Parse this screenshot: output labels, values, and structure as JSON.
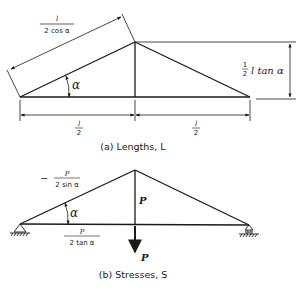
{
  "figure_a": {
    "caption": "(a) Lengths, L",
    "labels": {
      "chord_length_num": "l",
      "chord_length_den": "2 cos α",
      "angle": "α",
      "height_prefix_num": "1",
      "height_prefix_den": "2",
      "height_rest": "l tan α",
      "half_span_left_num": "l",
      "half_span_left_den": "2",
      "half_span_right_num": "l",
      "half_span_right_den": "2"
    }
  },
  "figure_b": {
    "caption": "(b) Stresses, S",
    "labels": {
      "chord_stress_sign": "−",
      "chord_stress_num": "P",
      "chord_stress_den": "2 sin α",
      "angle": "α",
      "vertical_stress": "P",
      "tie_stress_num": "P",
      "tie_stress_den": "2 tan α",
      "load": "P"
    }
  },
  "colors": {
    "ink": "#1a1a1a",
    "background": "#ffffff"
  }
}
